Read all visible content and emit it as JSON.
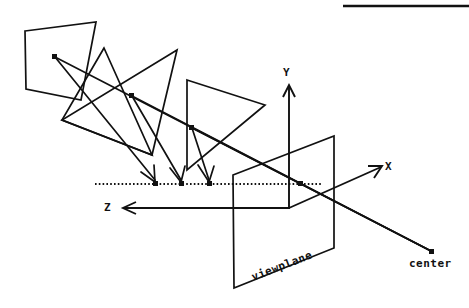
{
  "diagram": {
    "stroke_color": "#111111",
    "background_color": "#ffffff",
    "axes": [
      {
        "name": "y-axis",
        "label": "Y",
        "direction": "up",
        "label_x": 283,
        "label_y": 67
      },
      {
        "name": "x-axis",
        "label": "X",
        "direction": "upper-right",
        "label_x": 385,
        "label_y": 161
      },
      {
        "name": "z-axis",
        "label": "Z",
        "direction": "left",
        "label_x": 104,
        "label_y": 202
      }
    ],
    "labels": {
      "viewplane": "viewplane",
      "center": "center",
      "y_axis": "Y",
      "x_axis": "X",
      "z_axis": "Z"
    },
    "viewplane": {
      "label": "viewplane",
      "label_x": 252,
      "label_y": 272,
      "label_rotation_deg": -21,
      "corners": [
        [
          233,
          175
        ],
        [
          334,
          136
        ],
        [
          334,
          248
        ],
        [
          234,
          288
        ]
      ]
    },
    "center_point": {
      "label": "center",
      "x": 431,
      "y": 251,
      "label_x": 409,
      "label_y": 258
    },
    "projection_line": {
      "name": "projection-baseline",
      "y": 184,
      "x_start": 95,
      "x_end": 322,
      "style": "dotted",
      "points_x": [
        155,
        181,
        209,
        300
      ]
    },
    "polygons": [
      {
        "name": "source-quad",
        "points": "25,31 96,22 81,100 26,89"
      },
      {
        "name": "triangle-middle",
        "points": "177,50 62,120 152,155"
      },
      {
        "name": "triangle-left",
        "points": "104,48 62,120 152,155"
      },
      {
        "name": "triangle-right",
        "points": "187,80 265,105 187,170"
      }
    ],
    "projection_arrows": [
      {
        "name": "projector-1",
        "from": [
          55,
          57
        ],
        "to": [
          155,
          183
        ]
      },
      {
        "name": "projector-2",
        "from": [
          132,
          96
        ],
        "to": [
          181,
          183
        ]
      },
      {
        "name": "projector-3",
        "from": [
          192,
          128
        ],
        "to": [
          209,
          183
        ]
      }
    ],
    "sight_rays": [
      {
        "name": "ray-1",
        "from": [
          55,
          57
        ],
        "to": [
          431,
          251
        ]
      },
      {
        "name": "ray-2",
        "from": [
          132,
          96
        ],
        "to": [
          431,
          251
        ]
      },
      {
        "name": "ray-3",
        "from": [
          192,
          128
        ],
        "to": [
          431,
          251
        ]
      }
    ],
    "rule": {
      "name": "top-rule",
      "x1": 343,
      "y1": 6,
      "x2": 469,
      "y2": 6
    }
  }
}
